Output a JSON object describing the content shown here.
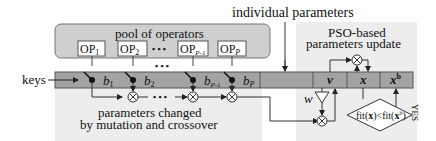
{
  "diagram": {
    "top_label": "individual parameters",
    "pool": {
      "title": "pool of operators",
      "operators": [
        {
          "base": "OP",
          "sub": "1"
        },
        {
          "base": "OP",
          "sub": "2"
        },
        {
          "base": "OP",
          "sub": "P-1"
        },
        {
          "base": "OP",
          "sub": "P"
        }
      ],
      "ellipsis": "• • •"
    },
    "input_label": "keys",
    "bits": [
      {
        "base": "b",
        "sub": "1"
      },
      {
        "base": "b",
        "sub": "2"
      },
      {
        "base": "b",
        "sub": "P-1"
      },
      {
        "base": "b",
        "sub": "P"
      }
    ],
    "mutation_caption_line1": "parameters changed",
    "mutation_caption_line2": "by mutation and crossover",
    "pso": {
      "title_line1": "PSO-based",
      "title_line2": "parameters update",
      "cells": [
        "v",
        "x",
        "x"
      ],
      "xb_superscript": "b",
      "weight_label": "w",
      "condition": "fit(x)<fit(xᵇ)",
      "condition_left": "fit(",
      "condition_x": "x",
      "condition_mid": ")<fit(",
      "condition_xb": "x",
      "condition_sup": "b",
      "condition_right": ")",
      "yes_label": "YES"
    },
    "colors": {
      "bar": "#a3a3a3",
      "pool_fill": "#cfcfcf",
      "panel_fill": "#ececec",
      "stroke": "#333333"
    }
  }
}
